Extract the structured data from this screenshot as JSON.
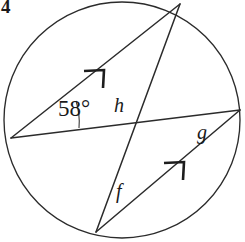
{
  "figure": {
    "question_number": "4",
    "shape": "circle",
    "angle_label": "58°",
    "angle_value": 58,
    "angle_unit": "degrees",
    "unknown_labels": {
      "h": "h",
      "g": "g",
      "f": "f"
    },
    "arrow_marks": [
      {
        "name": "arrow-upper-chord",
        "count": 1
      },
      {
        "name": "arrow-lower-chord",
        "count": 1
      }
    ],
    "colors": {
      "stroke": "#2b2b2b",
      "background": "#ffffff",
      "text": "#1a1a1a"
    },
    "geometry": {
      "circle": {
        "cx": 122,
        "cy": 120,
        "r": 118
      },
      "points": {
        "left": {
          "x": 11,
          "y": 138
        },
        "top": {
          "x": 180,
          "y": 4
        },
        "bottom": {
          "x": 96,
          "y": 232
        },
        "right": {
          "x": 240,
          "y": 110
        }
      },
      "chords": [
        {
          "name": "chord-left-top",
          "from": "left",
          "to": "top",
          "marked": true
        },
        {
          "name": "chord-left-right",
          "from": "left",
          "to": "right",
          "marked": false
        },
        {
          "name": "chord-top-bottom",
          "from": "top",
          "to": "bottom",
          "marked": false
        },
        {
          "name": "chord-bottom-right",
          "from": "bottom",
          "to": "right",
          "marked": true
        }
      ]
    }
  }
}
